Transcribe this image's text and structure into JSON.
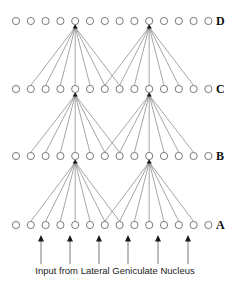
{
  "diagram": {
    "title": "",
    "layers": [
      {
        "label": "D",
        "y": 21
      },
      {
        "label": "C",
        "y": 89
      },
      {
        "label": "B",
        "y": 156
      },
      {
        "label": "A",
        "y": 225
      }
    ],
    "nodes_per_layer": 14,
    "node_x_start": 16,
    "node_spacing": 14.8,
    "node_radius": 3.6,
    "label_x": 216,
    "hub_indices": [
      4,
      9
    ],
    "fan_ranges": [
      {
        "hub": 4,
        "from": 1,
        "to": 7
      },
      {
        "hub": 9,
        "from": 6,
        "to": 12
      }
    ],
    "input_arrows_x": [
      41,
      70,
      99,
      128,
      158,
      188
    ],
    "input_arrow_top": 235,
    "input_arrow_bottom": 264,
    "caption": "Input from Lateral Geniculate Nucleus",
    "caption_x": 115,
    "caption_y": 274
  }
}
